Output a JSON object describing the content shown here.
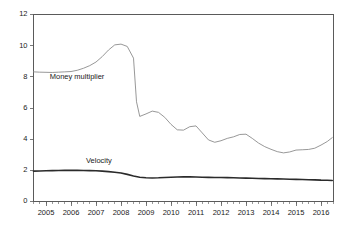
{
  "chart_data": {
    "type": "line",
    "title": "",
    "xlabel": "",
    "ylabel": "",
    "ylim": [
      0,
      12
    ],
    "xlim": [
      2004.5,
      2016.5
    ],
    "yticks": [
      0,
      2,
      4,
      6,
      8,
      10,
      12
    ],
    "ytick_labels": [
      "0",
      "2",
      "4",
      "6",
      "8",
      "10",
      "12"
    ],
    "xticks": [
      2005,
      2006,
      2007,
      2008,
      2009,
      2010,
      2011,
      2012,
      2013,
      2014,
      2015,
      2016
    ],
    "xtick_labels": [
      "2005",
      "2006",
      "2007",
      "2008",
      "2009",
      "2010",
      "2011",
      "2012",
      "2013",
      "2014",
      "2015",
      "2016"
    ],
    "minor_tick_interval": 0.25,
    "grid": false,
    "legend_position": "inline-annotation",
    "frame": "top-right-left",
    "annotations": [
      {
        "text": "Money multiplier",
        "x": 2005.15,
        "y": 7.85,
        "series": "Money multiplier"
      },
      {
        "text": "Velocity",
        "x": 2006.6,
        "y": 2.45,
        "series": "Velocity"
      }
    ],
    "series": [
      {
        "name": "Money multiplier",
        "color": "#8c8c8c",
        "width": 0.9,
        "x": [
          2004.5,
          2004.75,
          2005.0,
          2005.25,
          2005.5,
          2005.75,
          2006.0,
          2006.25,
          2006.5,
          2006.75,
          2007.0,
          2007.25,
          2007.5,
          2007.75,
          2008.0,
          2008.25,
          2008.5,
          2008.62,
          2008.75,
          2009.0,
          2009.25,
          2009.5,
          2009.75,
          2010.0,
          2010.25,
          2010.5,
          2010.75,
          2011.0,
          2011.25,
          2011.5,
          2011.75,
          2012.0,
          2012.25,
          2012.5,
          2012.75,
          2013.0,
          2013.25,
          2013.5,
          2013.75,
          2014.0,
          2014.25,
          2014.5,
          2014.75,
          2015.0,
          2015.25,
          2015.5,
          2015.75,
          2016.0,
          2016.25,
          2016.45
        ],
        "values": [
          8.32,
          8.3,
          8.29,
          8.28,
          8.3,
          8.32,
          8.34,
          8.42,
          8.55,
          8.72,
          8.95,
          9.3,
          9.72,
          10.05,
          10.1,
          9.95,
          9.2,
          6.4,
          5.46,
          5.62,
          5.8,
          5.72,
          5.4,
          4.95,
          4.6,
          4.58,
          4.8,
          4.85,
          4.4,
          3.95,
          3.8,
          3.9,
          4.05,
          4.15,
          4.3,
          4.32,
          4.05,
          3.75,
          3.52,
          3.35,
          3.2,
          3.12,
          3.18,
          3.3,
          3.32,
          3.34,
          3.42,
          3.62,
          3.85,
          4.1
        ]
      },
      {
        "name": "Velocity",
        "color": "#2b2b2b",
        "width": 1.6,
        "x": [
          2004.5,
          2004.75,
          2005.0,
          2005.25,
          2005.5,
          2005.75,
          2006.0,
          2006.25,
          2006.5,
          2006.75,
          2007.0,
          2007.25,
          2007.5,
          2007.75,
          2008.0,
          2008.25,
          2008.5,
          2008.75,
          2009.0,
          2009.25,
          2009.5,
          2009.75,
          2010.0,
          2010.25,
          2010.5,
          2010.75,
          2011.0,
          2011.25,
          2011.5,
          2011.75,
          2012.0,
          2012.25,
          2012.5,
          2012.75,
          2013.0,
          2013.25,
          2013.5,
          2013.75,
          2014.0,
          2014.25,
          2014.5,
          2014.75,
          2015.0,
          2015.25,
          2015.5,
          2015.75,
          2016.0,
          2016.25,
          2016.45
        ],
        "values": [
          1.95,
          1.96,
          1.97,
          1.98,
          1.99,
          2.0,
          2.0,
          2.0,
          1.99,
          1.98,
          1.97,
          1.95,
          1.92,
          1.88,
          1.83,
          1.74,
          1.64,
          1.56,
          1.52,
          1.51,
          1.52,
          1.54,
          1.56,
          1.57,
          1.58,
          1.58,
          1.57,
          1.56,
          1.55,
          1.54,
          1.54,
          1.53,
          1.52,
          1.51,
          1.5,
          1.49,
          1.48,
          1.47,
          1.46,
          1.45,
          1.44,
          1.43,
          1.42,
          1.41,
          1.4,
          1.39,
          1.37,
          1.36,
          1.35
        ]
      }
    ]
  },
  "figure": {
    "background": "#ffffff",
    "axis_color": "#5a5a5a",
    "text_color": "#1a1a1a"
  }
}
